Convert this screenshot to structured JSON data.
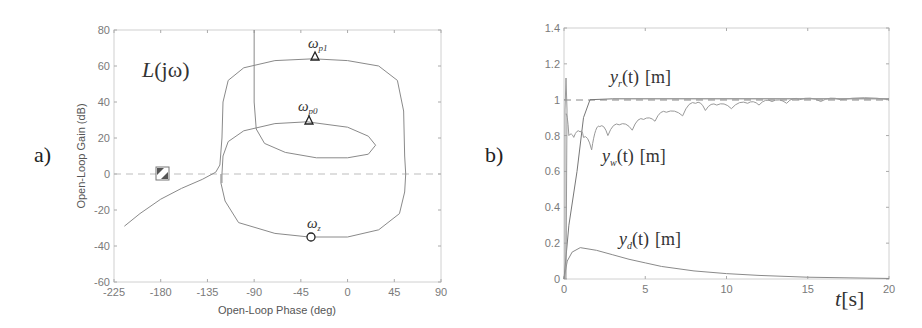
{
  "panels": {
    "a": {
      "label": "a)"
    },
    "b": {
      "label": "b)"
    }
  },
  "chart_data": [
    {
      "type": "line",
      "panel": "a",
      "title": "",
      "annotation_title": "L(jω)",
      "xlabel": "Open-Loop Phase (deg)",
      "ylabel": "Open-Loop Gain (dB)",
      "xlim": [
        -225,
        90
      ],
      "ylim": [
        -60,
        80
      ],
      "xticks": [
        "-225",
        "-180",
        "-135",
        "-90",
        "-45",
        "0",
        "45",
        "90"
      ],
      "yticks": [
        "80",
        "60",
        "40",
        "20",
        "0",
        "-20",
        "-40",
        "-60"
      ],
      "grid": false,
      "reference_line": {
        "y": 0,
        "style": "dashed"
      },
      "critical_point": {
        "x": -180,
        "y": 0,
        "marker": "square-hatched"
      },
      "markers": [
        {
          "name": "ω_p1",
          "x": -33,
          "y": 64,
          "marker": "triangle"
        },
        {
          "name": "ω_p0",
          "x": -39,
          "y": 29,
          "marker": "triangle"
        },
        {
          "name": "ω_z",
          "x": -37,
          "y": -35,
          "marker": "circle"
        }
      ],
      "series": [
        {
          "name": "curve1 (outer loop)",
          "points": [
            [
              -215,
              -29
            ],
            [
              -200,
              -22
            ],
            [
              -180,
              -14
            ],
            [
              -160,
              -8
            ],
            [
              -140,
              -3
            ],
            [
              -127,
              1
            ],
            [
              -123,
              5
            ],
            [
              -121,
              20
            ],
            [
              -120,
              40
            ],
            [
              -115,
              52
            ],
            [
              -100,
              59
            ],
            [
              -70,
              63
            ],
            [
              -33,
              64
            ],
            [
              0,
              63
            ],
            [
              30,
              60
            ],
            [
              48,
              52
            ],
            [
              54,
              35
            ],
            [
              55,
              10
            ],
            [
              56,
              0
            ],
            [
              55,
              -10
            ],
            [
              50,
              -22
            ],
            [
              30,
              -31
            ],
            [
              0,
              -35
            ],
            [
              -37,
              -35
            ],
            [
              -70,
              -33
            ],
            [
              -105,
              -27
            ],
            [
              -118,
              -15
            ],
            [
              -122,
              -5
            ],
            [
              -122,
              0
            ]
          ]
        },
        {
          "name": "curve2 (inner loop)",
          "points": [
            [
              -90,
              80
            ],
            [
              -90,
              40
            ],
            [
              -88,
              25
            ],
            [
              -80,
              17
            ],
            [
              -60,
              12
            ],
            [
              -30,
              9
            ],
            [
              0,
              9
            ],
            [
              20,
              11
            ],
            [
              27,
              16
            ],
            [
              20,
              21
            ],
            [
              0,
              26
            ],
            [
              -39,
              29
            ],
            [
              -70,
              28
            ],
            [
              -100,
              24
            ],
            [
              -115,
              18
            ],
            [
              -120,
              10
            ],
            [
              -121,
              0
            ],
            [
              -121,
              -5
            ]
          ]
        }
      ]
    },
    {
      "type": "line",
      "panel": "b",
      "title": "",
      "xlabel": "t[s]",
      "ylabel": "",
      "xlim": [
        0,
        20
      ],
      "ylim": [
        0,
        1.4
      ],
      "xticks": [
        "0",
        "5",
        "10",
        "15",
        "20"
      ],
      "yticks": [
        "1.4",
        "1.2",
        "1",
        "0.8",
        "0.6",
        "0.4",
        "0.2",
        "0"
      ],
      "grid": false,
      "reference_line": {
        "y": 1,
        "style": "dashed"
      },
      "series": [
        {
          "name": "y_r(t) [m]",
          "points": [
            [
              0,
              0
            ],
            [
              0.3,
              0.3
            ],
            [
              0.8,
              0.6
            ],
            [
              1.2,
              0.9
            ],
            [
              1.6,
              1.0
            ],
            [
              3,
              1.005
            ],
            [
              20,
              1.005
            ]
          ]
        },
        {
          "name": "y_w(t) [m]",
          "style": "segmented-oscillation",
          "points": [
            [
              0.1,
              0.92
            ],
            [
              0.3,
              0.8
            ],
            [
              0.6,
              0.79
            ],
            [
              1.0,
              0.82
            ],
            [
              1.2,
              0.79
            ],
            [
              1.7,
              0.72
            ],
            [
              2.2,
              0.85
            ],
            [
              2.7,
              0.8
            ],
            [
              3.4,
              0.86
            ],
            [
              4.2,
              0.83
            ],
            [
              4.9,
              0.89
            ],
            [
              5.6,
              0.88
            ],
            [
              6.3,
              0.93
            ],
            [
              7.3,
              0.91
            ],
            [
              8.1,
              0.98
            ],
            [
              8.7,
              0.94
            ],
            [
              9.4,
              0.97
            ],
            [
              10.3,
              0.95
            ],
            [
              11.3,
              0.98
            ],
            [
              12.0,
              0.97
            ],
            [
              12.8,
              0.99
            ],
            [
              13.7,
              0.98
            ],
            [
              14.5,
              1.0
            ],
            [
              15.8,
              0.99
            ],
            [
              17,
              1.0
            ],
            [
              20,
              1.0
            ]
          ]
        },
        {
          "name": "y_d(t) [m]",
          "points": [
            [
              0,
              0
            ],
            [
              0.2,
              0.1
            ],
            [
              0.5,
              0.15
            ],
            [
              1,
              0.175
            ],
            [
              2,
              0.16
            ],
            [
              3,
              0.135
            ],
            [
              4,
              0.11
            ],
            [
              5,
              0.09
            ],
            [
              6,
              0.07
            ],
            [
              8,
              0.045
            ],
            [
              10,
              0.03
            ],
            [
              12,
              0.02
            ],
            [
              15,
              0.01
            ],
            [
              20,
              0.003
            ]
          ]
        }
      ],
      "annotations": [
        {
          "text": "y_r(t) [m]",
          "x": 3,
          "y": 1.15
        },
        {
          "text": "y_w(t) [m]",
          "x": 2.5,
          "y": 0.68
        },
        {
          "text": "y_d(t) [m]",
          "x": 3.5,
          "y": 0.2
        }
      ]
    }
  ],
  "labels": {
    "a_title_L": "L",
    "a_title_arg": "(jω)",
    "a_xlabel": "Open-Loop Phase (deg)",
    "a_ylabel": "Open-Loop Gain (dB)",
    "a_wp1": "ω",
    "a_wp1_sub": "p1",
    "a_wp0": "ω",
    "a_wp0_sub": "p0",
    "a_wz": "ω",
    "a_wz_sub": "z",
    "b_yr": "y",
    "b_yr_sub": "r",
    "b_yw": "y",
    "b_yw_sub": "w",
    "b_yd": "y",
    "b_yd_sub": "d",
    "b_arg": "(t)",
    "b_unit": "[m]",
    "b_xlabel_t": "t",
    "b_xlabel_unit": "[s]"
  }
}
